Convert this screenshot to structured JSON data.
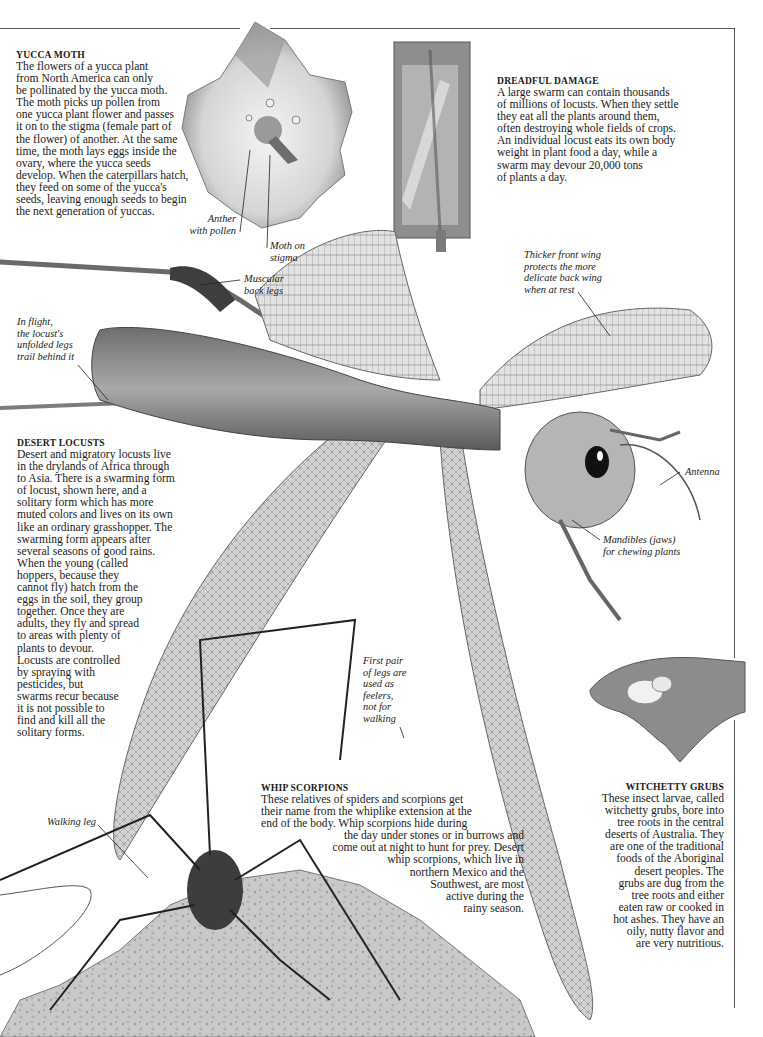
{
  "page": {
    "frame_color": "#555555"
  },
  "yucca_moth": {
    "heading": "YUCCA MOTH",
    "lines": [
      "The flowers of a yucca plant",
      "from North America can only",
      "be pollinated by the yucca moth.",
      "The moth picks up pollen from",
      "one yucca plant flower and passes",
      "it on to the stigma (female part of",
      "the flower) of another. At the same",
      "time, the moth lays eggs inside the",
      "ovary, where the yucca seeds",
      "develop. When the caterpillars hatch,",
      "they feed on some of the yucca's",
      "seeds, leaving enough seeds to begin",
      "the next generation of yuccas."
    ]
  },
  "dreadful_damage": {
    "heading": "DREADFUL DAMAGE",
    "lines": [
      "A large swarm can contain thousands",
      "of millions of locusts. When they settle",
      "they eat all the plants around them,",
      "often destroying whole fields of crops.",
      "An individual locust eats its own body",
      "weight in plant food a day, while a",
      "swarm may devour 20,000 tons",
      "of plants a day."
    ]
  },
  "desert_locusts": {
    "heading": "DESERT LOCUSTS",
    "lines": [
      "Desert and migratory locusts live",
      "in the drylands of Africa through",
      "to Asia. There is a swarming form",
      "of locust, shown here, and a",
      "solitary form which has more",
      "muted colors and lives on its own",
      "like an ordinary grasshopper. The",
      "swarming form appears after",
      "several seasons of good rains.",
      "When the young (called",
      "hoppers, because they",
      "cannot fly) hatch from the",
      "eggs in the soil, they group",
      "together. Once they are",
      "adults, they fly and spread",
      "to areas with plenty of",
      "plants to devour.",
      "Locusts are controlled",
      "by spraying with",
      "pesticides, but",
      "swarms recur because",
      "it is not possible to",
      "find and kill all the",
      "solitary forms."
    ]
  },
  "whip_scorpions": {
    "heading": "WHIP SCORPIONS",
    "lines": [
      "These relatives of spiders and scorpions get",
      "their name from the whiplike extension at the",
      "end of the body. Whip scorpions hide during",
      "the day under stones or in burrows and",
      "come out at night to hunt for prey. Desert",
      "whip scorpions, which live in",
      "northern Mexico and the",
      "Southwest, are most",
      "active during the",
      "rainy season."
    ]
  },
  "witchetty_grubs": {
    "heading": "WITCHETTY GRUBS",
    "lines": [
      "These insect larvae, called",
      "witchetty grubs, bore into",
      "tree roots in the central",
      "deserts of Australia. They",
      "are one of the traditional",
      "foods of the Aboriginal",
      "desert peoples. The",
      "grubs are dug from the",
      "tree roots and either",
      "eaten raw or cooked in",
      "hot ashes. They have an",
      "oily, nutty flavor and",
      "are very nutritious."
    ]
  },
  "captions": {
    "anther": [
      "Anther",
      "with pollen"
    ],
    "moth_on_stigma": [
      "Moth on",
      "stigma"
    ],
    "muscular_back_legs": [
      "Muscular",
      "back legs"
    ],
    "thicker_front_wing": [
      "Thicker front wing",
      "protects the more",
      "delicate back wing",
      "when at rest"
    ],
    "in_flight": [
      "In flight,",
      "the locust's",
      "unfolded legs",
      "trail behind it"
    ],
    "antenna": [
      "Antenna"
    ],
    "mandibles": [
      "Mandibles (jaws)",
      "for chewing plants"
    ],
    "first_pair_legs": [
      "First pair",
      "of legs are",
      "used as",
      "feelers,",
      "not for",
      "walking"
    ],
    "walking_leg": [
      "Walking leg"
    ]
  },
  "images": {
    "yucca_flower": "yucca-flower-photo",
    "damaged_frame": "locust-damaged-wooden-frame-photo",
    "locust": "desert-locust-in-flight-photo",
    "hand_grubs": "hand-holding-witchetty-grubs-photo",
    "whip_scorpion": "whip-scorpion-on-rock-photo"
  }
}
